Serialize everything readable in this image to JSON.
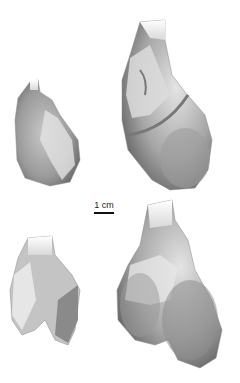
{
  "figure": {
    "panels": [
      {
        "id": "top-left",
        "description": "bone fragment, small, lateral view"
      },
      {
        "id": "top-right",
        "description": "bone distal end, large, lateral view"
      },
      {
        "id": "bottom-left",
        "description": "bone fragment, small, anterior view"
      },
      {
        "id": "bottom-right",
        "description": "bone distal end, large, anterior view"
      }
    ],
    "scale_bar": {
      "label": "1 cm"
    }
  },
  "colors": {
    "background": "#ffffff",
    "shade_dark": "#6e6e6e",
    "shade_mid": "#a8a8a8",
    "shade_light": "#dcdcdc"
  }
}
